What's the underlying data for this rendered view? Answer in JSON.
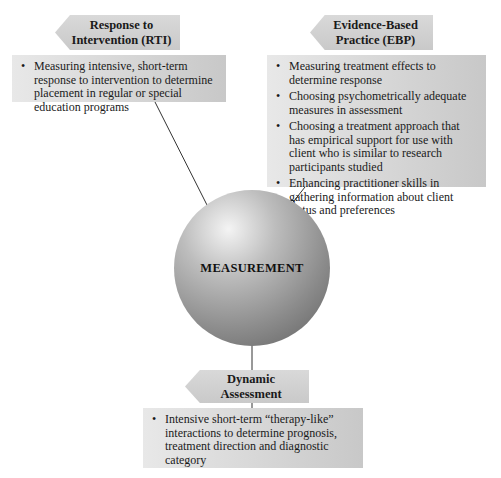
{
  "center": {
    "label": "MEASUREMENT"
  },
  "nodes": {
    "rti": {
      "title_line1": "Response to",
      "title_line2": "Intervention (RTI)",
      "items": [
        "Measuring intensive, short-term response to intervention to determine placement in regular or special education programs"
      ]
    },
    "ebp": {
      "title_line1": "Evidence-Based",
      "title_line2": "Practice (EBP)",
      "items": [
        "Measuring treatment effects to determine response",
        "Choosing psychometrically adequate measures in assessment",
        "Choosing a treatment approach that has empirical support for use with client who is similar to research participants studied",
        "Enhancing practitioner skills in gathering information about client status and preferences"
      ]
    },
    "da": {
      "title_line1": "Dynamic",
      "title_line2": "Assessment",
      "items": [
        "Intensive short-term “therapy-like” interactions to determine prognosis, treatment direction and diagnostic category"
      ]
    }
  },
  "bullet_glyph": "•",
  "colors": {
    "box_fill": "#d3d3d3",
    "line": "#333333"
  }
}
